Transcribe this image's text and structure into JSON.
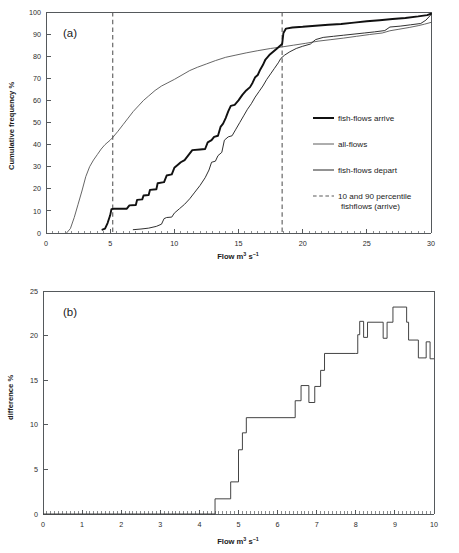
{
  "figure": {
    "background": "#ffffff",
    "ink": "#1a1a1a"
  },
  "panel_a": {
    "tag": "(a)",
    "xlabel_parts": {
      "base": "Flow m",
      "sup1": "3",
      "mid": " s",
      "sup2": "−1"
    },
    "xlabel": "Flow m3 s-1",
    "ylabel": "Cumulative frequency %",
    "xticks": [
      "0",
      "5",
      "10",
      "15",
      "20",
      "25",
      "30"
    ],
    "yticks": [
      "0",
      "10",
      "20",
      "30",
      "40",
      "50",
      "60",
      "70",
      "80",
      "90",
      "100"
    ],
    "legend": [
      {
        "label": "fish-flows arrive",
        "style": "thick-solid",
        "color": "#111111"
      },
      {
        "label": "all-flows",
        "style": "thin-solid",
        "color": "#4a4a4a"
      },
      {
        "label": "fish-flows depart",
        "style": "mid-solid",
        "color": "#262626"
      },
      {
        "label": "10 and 90 percentile",
        "label2": "fishflows (arrive)",
        "style": "dashed",
        "color": "#5a5a5a"
      }
    ]
  },
  "panel_b": {
    "tag": "(b)",
    "xlabel_parts": {
      "base": "Flow m",
      "sup1": "3",
      "mid": " s",
      "sup2": "−1"
    },
    "xlabel": "Flow m3 s-1",
    "ylabel": "difference %",
    "xticks": [
      "0",
      "1",
      "2",
      "3",
      "4",
      "5",
      "6",
      "7",
      "8",
      "9",
      "10"
    ],
    "yticks": [
      "0",
      "5",
      "10",
      "15",
      "20",
      "25"
    ]
  },
  "chart_data": [
    {
      "id": "panel-a",
      "type": "line",
      "title": "(a)",
      "xlabel": "Flow m3 s-1",
      "ylabel": "Cumulative frequency %",
      "xlim": [
        0,
        30
      ],
      "ylim": [
        0,
        100
      ],
      "xticks": [
        0,
        5,
        10,
        15,
        20,
        25,
        30
      ],
      "yticks": [
        0,
        10,
        20,
        30,
        40,
        50,
        60,
        70,
        80,
        90,
        100
      ],
      "grid": false,
      "legend_position": "right-middle",
      "annotations": [
        {
          "type": "vline",
          "x": 5.2,
          "label": "10 percentile fishflows (arrive)",
          "style": "dashed"
        },
        {
          "type": "vline",
          "x": 18.4,
          "label": "90 percentile fishflows (arrive)",
          "style": "dashed"
        }
      ],
      "series": [
        {
          "name": "all-flows",
          "style": "thin-solid",
          "points": [
            [
              1.6,
              0.0
            ],
            [
              1.9,
              2.0
            ],
            [
              2.2,
              7.0
            ],
            [
              2.5,
              13.0
            ],
            [
              2.8,
              19.0
            ],
            [
              3.1,
              25.5
            ],
            [
              3.4,
              30.0
            ],
            [
              3.7,
              33.0
            ],
            [
              4.0,
              35.5
            ],
            [
              4.3,
              38.0
            ],
            [
              4.6,
              40.0
            ],
            [
              5.0,
              42.0
            ],
            [
              5.2,
              43.2
            ],
            [
              5.6,
              46.0
            ],
            [
              6.0,
              49.0
            ],
            [
              6.4,
              52.0
            ],
            [
              6.8,
              55.0
            ],
            [
              7.2,
              57.5
            ],
            [
              7.6,
              60.0
            ],
            [
              8.0,
              62.0
            ],
            [
              8.5,
              64.5
            ],
            [
              9.0,
              66.5
            ],
            [
              9.5,
              68.0
            ],
            [
              10.0,
              69.5
            ],
            [
              10.6,
              71.5
            ],
            [
              11.2,
              73.5
            ],
            [
              11.8,
              75.0
            ],
            [
              12.5,
              76.5
            ],
            [
              13.2,
              78.0
            ],
            [
              14.0,
              79.5
            ],
            [
              14.8,
              80.5
            ],
            [
              15.6,
              81.5
            ],
            [
              16.5,
              82.5
            ],
            [
              17.5,
              83.5
            ],
            [
              18.4,
              84.2
            ],
            [
              19.3,
              85.0
            ],
            [
              20.2,
              85.8
            ],
            [
              21.2,
              86.8
            ],
            [
              22.2,
              87.5
            ],
            [
              23.2,
              88.2
            ],
            [
              24.2,
              89.0
            ],
            [
              25.2,
              89.8
            ],
            [
              26.2,
              90.5
            ],
            [
              26.8,
              91.5
            ],
            [
              27.5,
              92.2
            ],
            [
              28.3,
              93.0
            ],
            [
              29.0,
              93.8
            ],
            [
              29.5,
              94.5
            ],
            [
              30.0,
              95.3
            ]
          ]
        },
        {
          "name": "fish-flows arrive",
          "style": "thick-solid",
          "points": [
            [
              4.4,
              1.5
            ],
            [
              4.6,
              2.0
            ],
            [
              4.8,
              4.5
            ],
            [
              5.0,
              8.0
            ],
            [
              5.1,
              10.8
            ],
            [
              5.3,
              11.0
            ],
            [
              6.3,
              11.0
            ],
            [
              6.5,
              12.5
            ],
            [
              7.0,
              12.7
            ],
            [
              7.1,
              15.0
            ],
            [
              7.5,
              15.2
            ],
            [
              7.6,
              17.0
            ],
            [
              8.0,
              17.2
            ],
            [
              8.1,
              19.5
            ],
            [
              8.6,
              19.8
            ],
            [
              8.7,
              22.5
            ],
            [
              9.2,
              23.0
            ],
            [
              9.4,
              26.0
            ],
            [
              9.8,
              26.5
            ],
            [
              10.0,
              29.5
            ],
            [
              10.3,
              31.0
            ],
            [
              10.5,
              32.0
            ],
            [
              10.8,
              33.0
            ],
            [
              11.4,
              37.5
            ],
            [
              12.0,
              37.8
            ],
            [
              12.4,
              38.0
            ],
            [
              12.6,
              41.0
            ],
            [
              12.9,
              42.0
            ],
            [
              13.1,
              43.5
            ],
            [
              13.4,
              44.0
            ],
            [
              13.6,
              48.0
            ],
            [
              13.8,
              49.5
            ],
            [
              14.0,
              52.0
            ],
            [
              14.2,
              55.0
            ],
            [
              14.4,
              57.5
            ],
            [
              14.7,
              58.0
            ],
            [
              15.0,
              60.0
            ],
            [
              15.3,
              62.5
            ],
            [
              15.6,
              64.5
            ],
            [
              15.9,
              66.0
            ],
            [
              16.1,
              68.0
            ],
            [
              16.3,
              70.5
            ],
            [
              16.5,
              71.5
            ],
            [
              16.7,
              74.0
            ],
            [
              16.9,
              76.0
            ],
            [
              17.1,
              78.5
            ],
            [
              17.4,
              80.5
            ],
            [
              17.7,
              82.0
            ],
            [
              18.0,
              83.5
            ],
            [
              18.2,
              84.5
            ],
            [
              18.4,
              85.5
            ],
            [
              18.5,
              90.5
            ],
            [
              18.7,
              92.5
            ],
            [
              19.2,
              93.0
            ],
            [
              20.0,
              93.3
            ],
            [
              21.0,
              93.8
            ],
            [
              22.0,
              94.2
            ],
            [
              23.0,
              94.6
            ],
            [
              24.0,
              95.2
            ],
            [
              25.0,
              95.8
            ],
            [
              26.0,
              96.3
            ],
            [
              27.0,
              96.8
            ],
            [
              28.0,
              97.3
            ],
            [
              29.0,
              98.0
            ],
            [
              29.7,
              98.6
            ],
            [
              30.0,
              99.2
            ]
          ]
        },
        {
          "name": "fish-flows depart",
          "style": "mid-solid",
          "points": [
            [
              6.8,
              1.5
            ],
            [
              7.4,
              1.8
            ],
            [
              8.0,
              2.2
            ],
            [
              8.6,
              3.0
            ],
            [
              9.0,
              4.0
            ],
            [
              9.2,
              6.5
            ],
            [
              9.4,
              7.0
            ],
            [
              9.8,
              7.2
            ],
            [
              10.0,
              9.0
            ],
            [
              10.4,
              11.0
            ],
            [
              10.8,
              13.0
            ],
            [
              11.2,
              15.5
            ],
            [
              11.6,
              18.5
            ],
            [
              12.0,
              21.5
            ],
            [
              12.4,
              25.0
            ],
            [
              12.7,
              28.5
            ],
            [
              12.9,
              32.0
            ],
            [
              13.2,
              32.5
            ],
            [
              13.4,
              35.0
            ],
            [
              13.7,
              36.5
            ],
            [
              13.9,
              42.0
            ],
            [
              14.2,
              43.5
            ],
            [
              14.5,
              44.0
            ],
            [
              14.8,
              47.0
            ],
            [
              15.1,
              50.0
            ],
            [
              15.4,
              53.0
            ],
            [
              15.7,
              56.0
            ],
            [
              16.0,
              58.5
            ],
            [
              16.3,
              61.5
            ],
            [
              16.6,
              64.0
            ],
            [
              16.9,
              66.5
            ],
            [
              17.2,
              69.5
            ],
            [
              17.5,
              72.0
            ],
            [
              17.8,
              74.5
            ],
            [
              18.1,
              77.0
            ],
            [
              18.3,
              79.0
            ],
            [
              18.6,
              80.5
            ],
            [
              19.0,
              82.0
            ],
            [
              19.5,
              83.5
            ],
            [
              20.0,
              84.5
            ],
            [
              20.6,
              85.5
            ],
            [
              21.0,
              87.5
            ],
            [
              21.6,
              88.5
            ],
            [
              22.4,
              89.0
            ],
            [
              23.2,
              89.5
            ],
            [
              24.0,
              90.0
            ],
            [
              24.8,
              90.5
            ],
            [
              25.6,
              91.0
            ],
            [
              26.4,
              91.6
            ],
            [
              26.8,
              93.2
            ],
            [
              27.6,
              93.6
            ],
            [
              28.4,
              94.2
            ],
            [
              29.2,
              94.8
            ],
            [
              29.6,
              96.3
            ],
            [
              30.0,
              98.8
            ]
          ]
        }
      ]
    },
    {
      "id": "panel-b",
      "type": "line",
      "title": "(b)",
      "xlabel": "Flow m3 s-1",
      "ylabel": "difference %",
      "xlim": [
        0,
        10
      ],
      "ylim": [
        0,
        25
      ],
      "xticks": [
        0,
        1,
        2,
        3,
        4,
        5,
        6,
        7,
        8,
        9,
        10
      ],
      "yticks": [
        0,
        5,
        10,
        15,
        20,
        25
      ],
      "grid": false,
      "legend_position": "none",
      "step_style": "post",
      "series": [
        {
          "name": "difference",
          "style": "step",
          "points": [
            [
              0.0,
              0.0
            ],
            [
              4.4,
              0.0
            ],
            [
              4.4,
              1.7
            ],
            [
              4.8,
              1.7
            ],
            [
              4.8,
              3.6
            ],
            [
              5.0,
              3.6
            ],
            [
              5.0,
              7.2
            ],
            [
              5.1,
              7.2
            ],
            [
              5.1,
              9.1
            ],
            [
              5.2,
              9.1
            ],
            [
              5.2,
              10.8
            ],
            [
              6.45,
              10.8
            ],
            [
              6.45,
              12.7
            ],
            [
              6.6,
              12.7
            ],
            [
              6.6,
              14.4
            ],
            [
              6.8,
              14.4
            ],
            [
              6.8,
              12.5
            ],
            [
              6.95,
              12.5
            ],
            [
              6.95,
              14.3
            ],
            [
              7.1,
              14.3
            ],
            [
              7.1,
              16.1
            ],
            [
              7.2,
              16.1
            ],
            [
              7.2,
              18.0
            ],
            [
              8.0,
              18.0
            ],
            [
              8.05,
              18.0
            ],
            [
              8.05,
              20.1
            ],
            [
              8.1,
              20.1
            ],
            [
              8.1,
              21.6
            ],
            [
              8.2,
              21.6
            ],
            [
              8.2,
              19.8
            ],
            [
              8.3,
              19.8
            ],
            [
              8.3,
              21.5
            ],
            [
              8.7,
              21.5
            ],
            [
              8.7,
              19.7
            ],
            [
              8.8,
              19.7
            ],
            [
              8.8,
              21.5
            ],
            [
              8.95,
              21.5
            ],
            [
              8.95,
              23.2
            ],
            [
              9.3,
              23.2
            ],
            [
              9.3,
              21.5
            ],
            [
              9.35,
              21.5
            ],
            [
              9.35,
              19.5
            ],
            [
              9.6,
              19.5
            ],
            [
              9.6,
              17.5
            ],
            [
              9.8,
              17.5
            ],
            [
              9.8,
              19.3
            ],
            [
              9.9,
              19.3
            ],
            [
              9.9,
              17.4
            ],
            [
              10.0,
              17.4
            ]
          ]
        }
      ]
    }
  ]
}
